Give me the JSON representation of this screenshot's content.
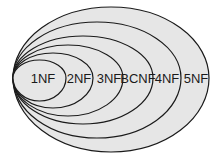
{
  "diagram": {
    "fill_color": "#e6e6e6",
    "stroke_color": "#1a1a1a",
    "sets": [
      {
        "label": "5NF",
        "left": 13,
        "right": 209,
        "top": 7,
        "bottom": 152,
        "label_x": 196
      },
      {
        "label": "4NF",
        "left": 13,
        "right": 181,
        "top": 22,
        "bottom": 138,
        "label_x": 167
      },
      {
        "label": "BCNF",
        "left": 13,
        "right": 153,
        "top": 36,
        "bottom": 124,
        "label_x": 138
      },
      {
        "label": "3NF",
        "left": 13,
        "right": 123,
        "top": 45,
        "bottom": 116,
        "label_x": 109
      },
      {
        "label": "2NF",
        "left": 13,
        "right": 93,
        "top": 53,
        "bottom": 108,
        "label_x": 79
      },
      {
        "label": "1NF",
        "left": 13,
        "right": 66,
        "top": 60,
        "bottom": 101,
        "label_x": 43
      }
    ]
  }
}
